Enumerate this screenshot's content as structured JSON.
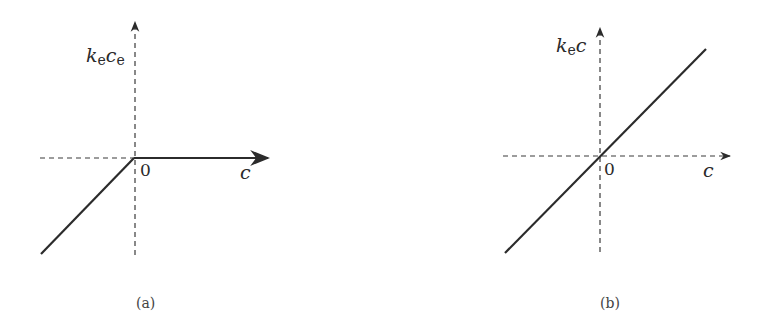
{
  "panels": [
    {
      "id": "a",
      "caption": "(a)",
      "y_label": {
        "var1": "k",
        "sub1": "e",
        "var2": "c",
        "sub2": "e"
      },
      "x_label": "c",
      "origin_label": "0",
      "curve": "piecewise: slope 1 for c<0, zero for c>=0 (k_e c_e = min(k_e c, 0))"
    },
    {
      "id": "b",
      "caption": "(b)",
      "y_label": {
        "var1": "k",
        "sub1": "e",
        "var2": "c"
      },
      "x_label": "c",
      "origin_label": "0",
      "curve": "linear through origin, positive slope (k_e c)"
    }
  ],
  "colors": {
    "line": "#2b2b2b",
    "axis_dash": "#3a3a3a",
    "background": "#ffffff"
  }
}
